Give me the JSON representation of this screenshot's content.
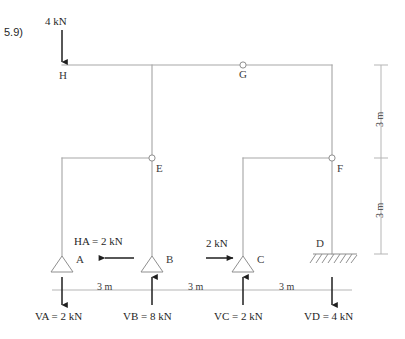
{
  "problem": {
    "number": "5.9)"
  },
  "colors": {
    "structure_line": "#a8a8a8",
    "dimension_line": "#b5b5b5",
    "force_arrow": "#1f1f1f",
    "text": "#2b2b2b",
    "background": "#ffffff"
  },
  "nodes": [
    {
      "id": "H",
      "label": "H",
      "type": "rigid-joint"
    },
    {
      "id": "G",
      "label": "G",
      "type": "hinge"
    },
    {
      "id": "E",
      "label": "E",
      "type": "hinge"
    },
    {
      "id": "F",
      "label": "F",
      "type": "hinge"
    },
    {
      "id": "A",
      "label": "A",
      "type": "pin-support"
    },
    {
      "id": "B",
      "label": "B",
      "type": "pin-support"
    },
    {
      "id": "C",
      "label": "C",
      "type": "pin-support"
    },
    {
      "id": "D",
      "label": "D",
      "type": "fixed-support"
    }
  ],
  "applied_loads": [
    {
      "id": "load-top",
      "label": "4 kN",
      "direction": "down",
      "at": "H"
    },
    {
      "id": "load-ha",
      "label": "HA = 2 kN",
      "direction": "left",
      "at": "A"
    },
    {
      "id": "load-c",
      "label": "2 kN",
      "direction": "right",
      "at": "C"
    }
  ],
  "reactions": [
    {
      "id": "va",
      "label": "VA = 2 kN",
      "direction": "down",
      "at": "A"
    },
    {
      "id": "vb",
      "label": "VB = 8 kN",
      "direction": "up",
      "at": "B"
    },
    {
      "id": "vc",
      "label": "VC = 2 kN",
      "direction": "up",
      "at": "C"
    },
    {
      "id": "vd",
      "label": "VD = 4 kN",
      "direction": "down",
      "at": "D"
    }
  ],
  "dimensions": {
    "horizontal": [
      {
        "id": "span-ab",
        "label": "3 m"
      },
      {
        "id": "span-bc",
        "label": "3 m"
      },
      {
        "id": "span-cd",
        "label": "3 m"
      }
    ],
    "vertical": [
      {
        "id": "height-upper",
        "label": "3 m"
      },
      {
        "id": "height-lower",
        "label": "3 m"
      }
    ]
  }
}
